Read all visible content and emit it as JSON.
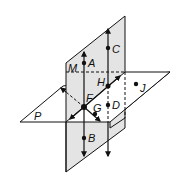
{
  "diagram": {
    "colors": {
      "background": "#ffffff",
      "plane_fill": "#e4e4e4",
      "stroke": "#111111"
    },
    "planes": [
      {
        "id": "M",
        "label": "M",
        "orientation": "vertical"
      },
      {
        "id": "P",
        "label": "P",
        "orientation": "horizontal"
      }
    ],
    "points": [
      {
        "label": "A"
      },
      {
        "label": "B"
      },
      {
        "label": "C"
      },
      {
        "label": "D"
      },
      {
        "label": "F"
      },
      {
        "label": "G"
      },
      {
        "label": "H"
      },
      {
        "label": "J"
      }
    ]
  }
}
